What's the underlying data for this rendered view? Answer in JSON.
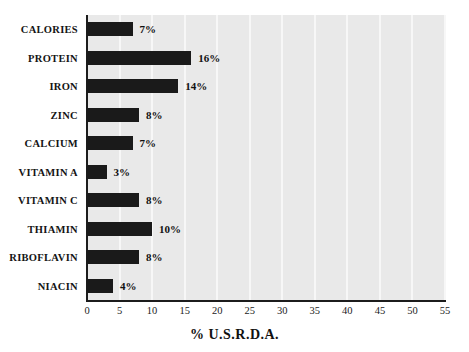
{
  "chart_data": {
    "type": "bar",
    "orientation": "horizontal",
    "title": "",
    "xlabel": "% U.S.R.D.A.",
    "ylabel": "",
    "xlim": [
      0,
      55
    ],
    "xticks": [
      "0",
      "5",
      "10",
      "15",
      "20",
      "25",
      "30",
      "35",
      "40",
      "45",
      "50",
      "55"
    ],
    "grid": true,
    "grid_axis": "x",
    "legend": false,
    "categories": [
      "CALORIES",
      "PROTEIN",
      "IRON",
      "ZINC",
      "CALCIUM",
      "VITAMIN A",
      "VITAMIN C",
      "THIAMIN",
      "RIBOFLAVIN",
      "NIACIN"
    ],
    "values": [
      7,
      16,
      14,
      8,
      7,
      3,
      8,
      10,
      8,
      4
    ],
    "value_labels": [
      "7%",
      "16%",
      "14%",
      "8%",
      "7%",
      "3%",
      "8%",
      "10%",
      "8%",
      "4%"
    ],
    "bar_color": "#1a1a1a",
    "plot_background": "#e9e9e9",
    "gridline_color": "#f7f7f7",
    "axis_color": "#1c1c1c",
    "page_background": "#ffffff"
  }
}
